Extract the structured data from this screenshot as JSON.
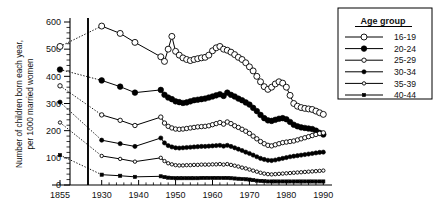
{
  "figure": {
    "ylabel": "Number of children born each year,  per 1000 married women",
    "ylabel_line1": "Number of children born each year,",
    "ylabel_line2": "per 1000 married women"
  },
  "legend": {
    "title": "Age  group",
    "entries": [
      {
        "label": "16-19",
        "marker": "open-circle",
        "size": 3.0
      },
      {
        "label": "20-24",
        "marker": "filled-circle",
        "size": 2.8
      },
      {
        "label": "25-29",
        "marker": "open-circle",
        "size": 2.2
      },
      {
        "label": "30-34",
        "marker": "filled-circle",
        "size": 2.1
      },
      {
        "label": "35-39",
        "marker": "open-circle",
        "size": 1.7
      },
      {
        "label": "40-44",
        "marker": "filled-square",
        "size": 1.6
      }
    ]
  },
  "chart_data": {
    "type": "line",
    "title": "",
    "xlabel": "",
    "ylabel": "Number of children born each year, per 1000 married women",
    "xlim": [
      1928,
      1991
    ],
    "ylim": [
      0,
      620
    ],
    "yticks": [
      0,
      100,
      200,
      300,
      400,
      500,
      600
    ],
    "xticks": [
      1855,
      1930,
      1940,
      1950,
      1960,
      1970,
      1980,
      1990
    ],
    "axis_break": {
      "after_label": "1855",
      "note": "discontinuous x-axis between 1855 and 1930"
    },
    "grid": false,
    "legend_position": "right-outside",
    "anchor_year": 1855,
    "series": [
      {
        "name": "16-19",
        "marker": "open-circle",
        "anchor_value": 510,
        "x": [
          1930,
          1935,
          1939,
          1946,
          1947,
          1948,
          1949,
          1950,
          1951,
          1952,
          1953,
          1954,
          1955,
          1956,
          1957,
          1958,
          1959,
          1960,
          1961,
          1962,
          1963,
          1964,
          1965,
          1966,
          1967,
          1968,
          1969,
          1970,
          1971,
          1972,
          1973,
          1974,
          1975,
          1976,
          1977,
          1978,
          1979,
          1980,
          1981,
          1982,
          1983,
          1984,
          1985,
          1986,
          1987,
          1988,
          1989,
          1990
        ],
        "values": [
          585,
          558,
          525,
          472,
          455,
          500,
          547,
          492,
          478,
          468,
          462,
          458,
          462,
          465,
          468,
          470,
          478,
          494,
          505,
          510,
          500,
          496,
          489,
          480,
          470,
          462,
          450,
          435,
          420,
          400,
          380,
          362,
          352,
          360,
          372,
          380,
          375,
          360,
          330,
          300,
          290,
          285,
          282,
          280,
          278,
          272,
          266,
          260
        ]
      },
      {
        "name": "20-24",
        "marker": "filled-circle",
        "anchor_value": 425,
        "x": [
          1930,
          1935,
          1939,
          1946,
          1947,
          1948,
          1949,
          1950,
          1951,
          1952,
          1953,
          1954,
          1955,
          1956,
          1957,
          1958,
          1959,
          1960,
          1961,
          1962,
          1963,
          1964,
          1965,
          1966,
          1967,
          1968,
          1969,
          1970,
          1971,
          1972,
          1973,
          1974,
          1975,
          1976,
          1977,
          1978,
          1979,
          1980,
          1981,
          1982,
          1983,
          1984,
          1985,
          1986,
          1987,
          1988,
          1989,
          1990
        ],
        "values": [
          385,
          362,
          340,
          350,
          332,
          322,
          316,
          308,
          305,
          302,
          304,
          308,
          312,
          314,
          316,
          318,
          322,
          326,
          330,
          334,
          328,
          340,
          332,
          326,
          318,
          312,
          304,
          296,
          284,
          272,
          258,
          246,
          238,
          236,
          240,
          244,
          246,
          242,
          232,
          222,
          216,
          212,
          210,
          208,
          206,
          200,
          192,
          186
        ]
      },
      {
        "name": "25-29",
        "marker": "open-circle",
        "anchor_value": 365,
        "x": [
          1930,
          1935,
          1939,
          1946,
          1947,
          1948,
          1949,
          1950,
          1951,
          1952,
          1953,
          1954,
          1955,
          1956,
          1957,
          1958,
          1959,
          1960,
          1961,
          1962,
          1963,
          1964,
          1965,
          1966,
          1967,
          1968,
          1969,
          1970,
          1971,
          1972,
          1973,
          1974,
          1975,
          1976,
          1977,
          1978,
          1979,
          1980,
          1981,
          1982,
          1983,
          1984,
          1985,
          1986,
          1987,
          1988,
          1989,
          1990
        ],
        "values": [
          258,
          238,
          219,
          250,
          228,
          216,
          210,
          206,
          205,
          206,
          208,
          210,
          212,
          214,
          215,
          216,
          218,
          222,
          226,
          230,
          224,
          232,
          226,
          218,
          212,
          205,
          198,
          190,
          180,
          170,
          160,
          152,
          146,
          144,
          148,
          152,
          156,
          158,
          160,
          162,
          166,
          170,
          174,
          178,
          182,
          186,
          190,
          192
        ]
      },
      {
        "name": "30-34",
        "marker": "filled-circle",
        "anchor_value": 305,
        "x": [
          1930,
          1935,
          1939,
          1946,
          1947,
          1948,
          1949,
          1950,
          1951,
          1952,
          1953,
          1954,
          1955,
          1956,
          1957,
          1958,
          1959,
          1960,
          1961,
          1962,
          1963,
          1964,
          1965,
          1966,
          1967,
          1968,
          1969,
          1970,
          1971,
          1972,
          1973,
          1974,
          1975,
          1976,
          1977,
          1978,
          1979,
          1980,
          1981,
          1982,
          1983,
          1984,
          1985,
          1986,
          1987,
          1988,
          1989,
          1990
        ],
        "values": [
          165,
          152,
          142,
          173,
          155,
          145,
          140,
          137,
          136,
          137,
          138,
          139,
          140,
          141,
          142,
          142,
          143,
          144,
          145,
          146,
          143,
          146,
          142,
          137,
          132,
          127,
          121,
          116,
          110,
          104,
          98,
          94,
          91,
          90,
          92,
          95,
          98,
          101,
          104,
          106,
          108,
          110,
          112,
          114,
          116,
          118,
          120,
          121
        ]
      },
      {
        "name": "35-39",
        "marker": "open-circle",
        "anchor_value": 230,
        "x": [
          1930,
          1935,
          1939,
          1946,
          1947,
          1948,
          1949,
          1950,
          1951,
          1952,
          1953,
          1954,
          1955,
          1956,
          1957,
          1958,
          1959,
          1960,
          1961,
          1962,
          1963,
          1964,
          1965,
          1966,
          1967,
          1968,
          1969,
          1970,
          1971,
          1972,
          1973,
          1974,
          1975,
          1976,
          1977,
          1978,
          1979,
          1980,
          1981,
          1982,
          1983,
          1984,
          1985,
          1986,
          1987,
          1988,
          1989,
          1990
        ],
        "values": [
          107,
          96,
          86,
          100,
          88,
          80,
          76,
          73,
          72,
          72,
          73,
          73,
          74,
          74,
          75,
          75,
          75,
          76,
          76,
          77,
          75,
          77,
          74,
          71,
          68,
          64,
          61,
          57,
          53,
          49,
          45,
          42,
          40,
          39,
          40,
          41,
          42,
          43,
          44,
          45,
          46,
          47,
          48,
          49,
          50,
          51,
          52,
          53
        ]
      },
      {
        "name": "40-44",
        "marker": "filled-square",
        "anchor_value": 110,
        "x": [
          1930,
          1935,
          1939,
          1946,
          1947,
          1948,
          1949,
          1950,
          1951,
          1952,
          1953,
          1954,
          1955,
          1956,
          1957,
          1958,
          1959,
          1960,
          1961,
          1962,
          1963,
          1964,
          1965,
          1966,
          1967,
          1968,
          1969,
          1970,
          1971,
          1972,
          1973,
          1974,
          1975,
          1976,
          1977,
          1978,
          1979,
          1980,
          1981,
          1982,
          1983,
          1984,
          1985,
          1986,
          1987,
          1988,
          1989,
          1990
        ],
        "values": [
          38,
          34,
          30,
          32,
          29,
          27,
          26,
          25,
          25,
          25,
          25,
          25,
          25,
          25,
          26,
          26,
          26,
          26,
          26,
          26,
          26,
          26,
          25,
          24,
          23,
          22,
          21,
          20,
          18,
          16,
          15,
          14,
          13,
          13,
          13,
          13,
          13,
          13,
          13,
          13,
          13,
          13,
          13,
          13,
          13,
          13,
          13,
          13
        ]
      }
    ]
  }
}
